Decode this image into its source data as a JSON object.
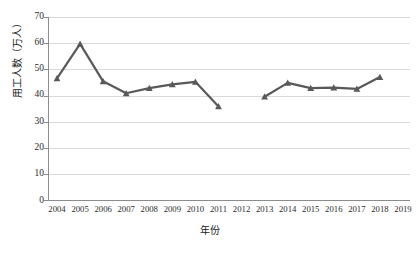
{
  "chart_data": {
    "type": "line",
    "title": "",
    "xlabel": "年份",
    "ylabel": "用工人数（万人）",
    "xlim": [
      2004,
      2019
    ],
    "ylim": [
      0,
      70
    ],
    "ytick_step": 10,
    "grid": "horizontal",
    "legend": "none",
    "marker": "triangle",
    "series_color": "#595959",
    "categories": [
      2004,
      2005,
      2006,
      2007,
      2008,
      2009,
      2010,
      2011,
      2012,
      2013,
      2014,
      2015,
      2016,
      2017,
      2018,
      2019
    ],
    "xticks": [
      "2004",
      "2005",
      "2006",
      "2007",
      "2008",
      "2009",
      "2010",
      "2011",
      "2012",
      "2013",
      "2014",
      "2015",
      "2016",
      "2017",
      "2018",
      "2019"
    ],
    "yticks": [
      "0",
      "10",
      "20",
      "30",
      "40",
      "50",
      "60",
      "70"
    ],
    "series": [
      {
        "name": "用工人数",
        "values": [
          46.5,
          59.7,
          45.4,
          40.8,
          42.8,
          44.2,
          45.2,
          35.8,
          null,
          39.5,
          44.8,
          42.8,
          43.0,
          42.5,
          47.0,
          null
        ]
      }
    ]
  }
}
